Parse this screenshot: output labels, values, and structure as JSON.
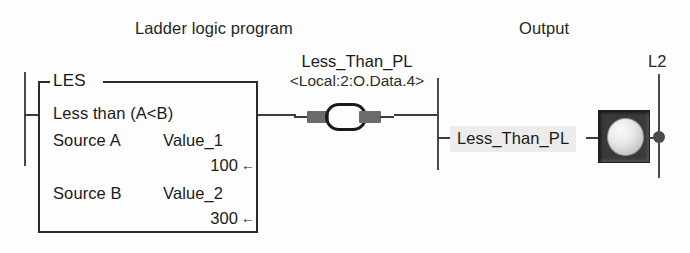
{
  "diagram": {
    "titles": {
      "ladder": "Ladder logic program",
      "output": "Output"
    },
    "left_rail": {
      "name": "L1-rail"
    },
    "les_block": {
      "mnemonic": "LES",
      "description": "Less than (A<B)",
      "operands": [
        {
          "label": "Source A",
          "tag": "Value_1",
          "value": "100",
          "arrow": "←"
        },
        {
          "label": "Source B",
          "tag": "Value_2",
          "value": "300",
          "arrow": "←"
        }
      ]
    },
    "coil": {
      "tag": "Less_Than_PL",
      "address": "<Local:2:O.Data.4>",
      "type": "output-energize-coil"
    },
    "output_section": {
      "lamp_label": "Less_Than_PL",
      "lamp_type": "pilot-light",
      "right_rail_label": "L2"
    },
    "colors": {
      "line": "#2b2b2b",
      "wire": "#3d3d3d",
      "rail": "#4a4a4a",
      "coil_pad": "#6b6b6b",
      "lamp_frame": "#3a3a3a",
      "label_highlight": "#ececec",
      "background": "#fdfdfd"
    }
  }
}
